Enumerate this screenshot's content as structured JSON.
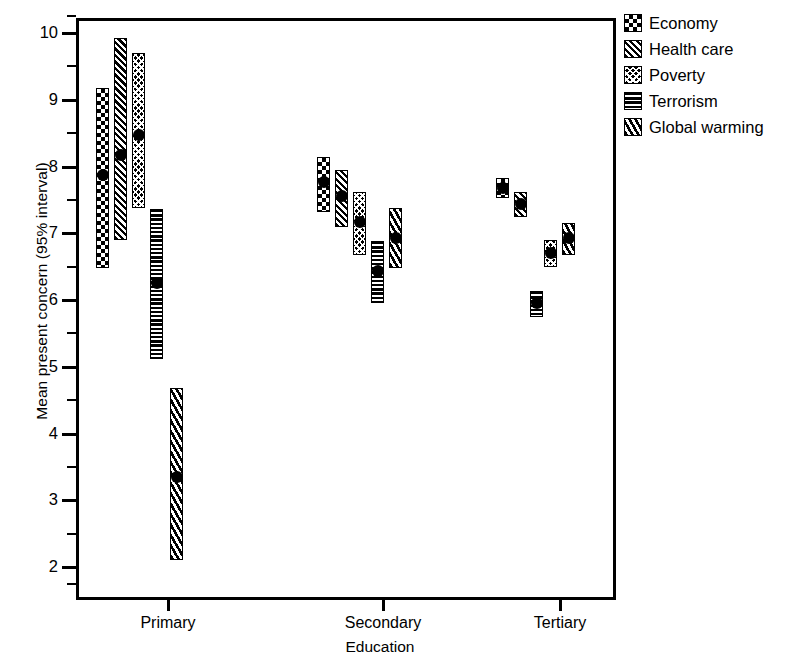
{
  "chart_data": {
    "type": "scatter",
    "title": "",
    "xlabel": "Education",
    "ylabel": "Mean present concern (95% interval)",
    "ylim": [
      1.7,
      10.35
    ],
    "yticks": [
      2,
      3,
      4,
      5,
      6,
      7,
      8,
      9,
      10
    ],
    "ytick_minor_step": 0.5,
    "grid": false,
    "legend_position": "top-right",
    "categories": [
      "Primary",
      "Secondary",
      "Tertiary"
    ],
    "error_bar_note": "Mean with 95% confidence interval",
    "series": [
      {
        "name": "Economy",
        "pattern": "checkerboard",
        "means": [
          7.87,
          7.77,
          7.68
        ],
        "ci_low": [
          6.48,
          7.32,
          7.53
        ],
        "ci_high": [
          9.18,
          8.14,
          7.83
        ]
      },
      {
        "name": "Health care",
        "pattern": "diagonal-hatch",
        "means": [
          8.17,
          7.56,
          7.44
        ],
        "ci_low": [
          6.9,
          7.09,
          7.25
        ],
        "ci_high": [
          9.92,
          7.95,
          7.62
        ]
      },
      {
        "name": "Poverty",
        "pattern": "cross-hatch",
        "means": [
          8.47,
          7.17,
          6.7
        ],
        "ci_low": [
          7.38,
          6.67,
          6.49
        ],
        "ci_high": [
          9.7,
          7.62,
          6.9
        ]
      },
      {
        "name": "Terrorism",
        "pattern": "horizontal-lines",
        "means": [
          6.25,
          6.43,
          5.95
        ],
        "ci_low": [
          5.12,
          5.95,
          5.75
        ],
        "ci_high": [
          7.37,
          6.88,
          6.14
        ]
      },
      {
        "name": "Global warming",
        "pattern": "diagonal-stripes",
        "means": [
          3.35,
          6.93,
          6.93
        ],
        "ci_low": [
          2.1,
          6.48,
          6.67
        ],
        "ci_high": [
          4.68,
          7.38,
          7.15
        ]
      }
    ]
  },
  "axes": {
    "y_title": "Mean present concern (95% interval)",
    "x_title": "Education",
    "y_tick_labels": [
      "10",
      "9",
      "8",
      "7",
      "6",
      "5",
      "4",
      "3",
      "2"
    ],
    "x_tick_labels": [
      "Primary",
      "Secondary",
      "Tertiary"
    ]
  },
  "legend": {
    "items": [
      {
        "label": "Economy"
      },
      {
        "label": "Health care"
      },
      {
        "label": "Poverty"
      },
      {
        "label": "Terrorism"
      },
      {
        "label": "Global warming"
      }
    ]
  }
}
